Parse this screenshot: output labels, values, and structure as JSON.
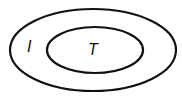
{
  "diagram": {
    "type": "nested-sets",
    "outer_set": {
      "label": "I"
    },
    "inner_set": {
      "label": "T"
    },
    "relation": "T is a subset of I"
  }
}
